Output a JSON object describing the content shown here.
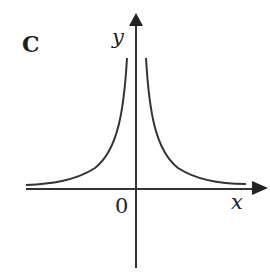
{
  "panel_label": "C",
  "axes": {
    "x_label": "x",
    "y_label": "y",
    "origin_label": "0"
  },
  "curve": {
    "description": "y = 1/|x| style graph symmetric about the y-axis, two branches approaching x-axis asymptotically",
    "color": "#333333"
  },
  "colors": {
    "axis": "#333333",
    "background": "#ffffff"
  }
}
